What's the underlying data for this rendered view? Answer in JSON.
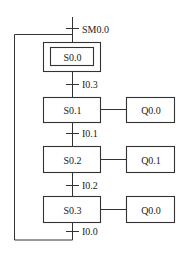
{
  "diagram": {
    "type": "sequential function chart (SFC)",
    "initial_step": {
      "label": "S0.0",
      "double_border": true
    },
    "initial_transition": {
      "label": "SM0.0"
    },
    "steps": [
      {
        "label": "S0.1",
        "action": "Q0.0"
      },
      {
        "label": "S0.2",
        "action": "Q0.1"
      },
      {
        "label": "S0.3",
        "action": "Q0.0"
      }
    ],
    "transitions": [
      "I0.3",
      "I0.1",
      "I0.2",
      "I0.0"
    ],
    "loop_back_to": "S0.0"
  }
}
